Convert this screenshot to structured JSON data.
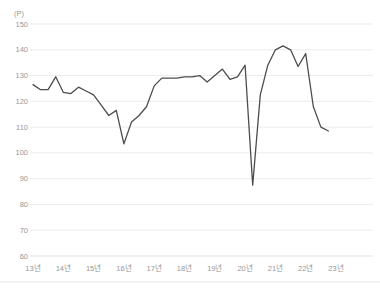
{
  "chart_data": {
    "type": "line",
    "title": "",
    "unit_label": "(P)",
    "xlabel": "",
    "ylabel": "",
    "ylim": [
      60,
      150
    ],
    "grid": "horizontal",
    "legend": "none",
    "y_ticks": [
      150,
      140,
      130,
      120,
      110,
      100,
      90,
      80,
      70,
      60
    ],
    "x_tick_labels": [
      "13년",
      "14년",
      "15년",
      "16년",
      "17년",
      "18년",
      "19년",
      "20년",
      "21년",
      "22년",
      "23년"
    ],
    "points_per_year": 4,
    "series": [
      {
        "name": "index",
        "start": "13년 Q1",
        "end": "22년 Q4",
        "color": "#4d4d4d",
        "values": [
          126.5,
          124.5,
          124.5,
          129.5,
          123.5,
          123,
          125.5,
          124,
          122.5,
          118.5,
          114.5,
          116.5,
          103.5,
          112,
          114.5,
          118,
          126,
          129,
          129,
          129,
          129.5,
          129.5,
          130,
          127.5,
          130,
          132.5,
          128.5,
          129.5,
          134,
          87.5,
          122.5,
          134,
          140,
          141.5,
          140,
          133.5,
          138.5,
          118,
          110,
          108.5
        ]
      }
    ]
  },
  "style": {
    "grid_color": "#ececec",
    "baseline_color": "#e2e2e2",
    "bottom_border_color": "#e8e8e8",
    "label_color": "#979797",
    "line_color": "#4d4d4d"
  }
}
